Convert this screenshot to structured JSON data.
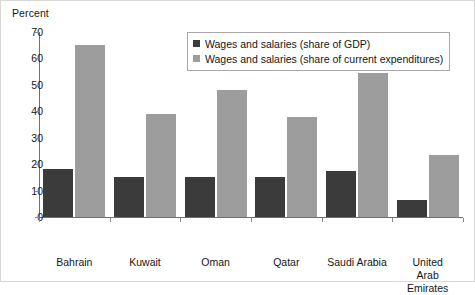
{
  "chart_data": {
    "type": "bar",
    "title": "",
    "subtitle": "",
    "xlabel": "",
    "ylabel": "Percent",
    "ylim": [
      0,
      70
    ],
    "yticks": [
      0,
      10,
      20,
      30,
      40,
      50,
      60,
      70
    ],
    "grid": false,
    "legend_position": "top-right",
    "categories": [
      "Bahrain",
      "Kuwait",
      "Oman",
      "Qatar",
      "Saudi Arabia",
      "United\nArab\nEmirates"
    ],
    "series": [
      {
        "name": "Wages and salaries (share of GDP)",
        "color": "#3b3b3b",
        "values": [
          18,
          15,
          15,
          15,
          17.5,
          6.5
        ]
      },
      {
        "name": "Wages and salaries (share of current expenditures)",
        "color": "#9d9d9d",
        "values": [
          65,
          39,
          48,
          38,
          54.5,
          23.5
        ]
      }
    ]
  },
  "legend": {
    "items": [
      {
        "label": "Wages and salaries (share of GDP)"
      },
      {
        "label": "Wages and salaries (share of current expenditures)"
      }
    ]
  },
  "axis": {
    "y_title": "Percent"
  },
  "colors": {
    "series_0": "#3b3b3b",
    "series_1": "#9d9d9d",
    "axis_line": "#6f6f6f",
    "frame": "#d8d8d8",
    "text": "#161616"
  }
}
